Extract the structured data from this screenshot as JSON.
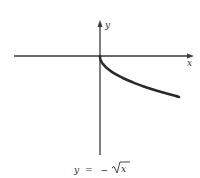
{
  "chart_data": {
    "type": "line",
    "title": "",
    "caption": "y = −√x",
    "caption_parts": {
      "lhs": "y",
      "eq": "=",
      "minus": "−",
      "radicand": "x"
    },
    "xlabel": "x",
    "ylabel": "y",
    "grid": false,
    "legend": null,
    "function": "y = -sqrt(x)",
    "domain": [
      0,
      null
    ],
    "series": [
      {
        "name": "y = -√x",
        "x": [
          0,
          0.25,
          1,
          2.25,
          4,
          6.25,
          9
        ],
        "values": [
          0,
          -0.5,
          -1,
          -1.5,
          -2,
          -2.5,
          -3
        ]
      }
    ],
    "axes": {
      "arrows": true,
      "ticks": false
    }
  },
  "colors": {
    "axis": "#3a3a3a",
    "curve": "#2a2a2a",
    "text": "#333333",
    "background": "#ffffff"
  }
}
